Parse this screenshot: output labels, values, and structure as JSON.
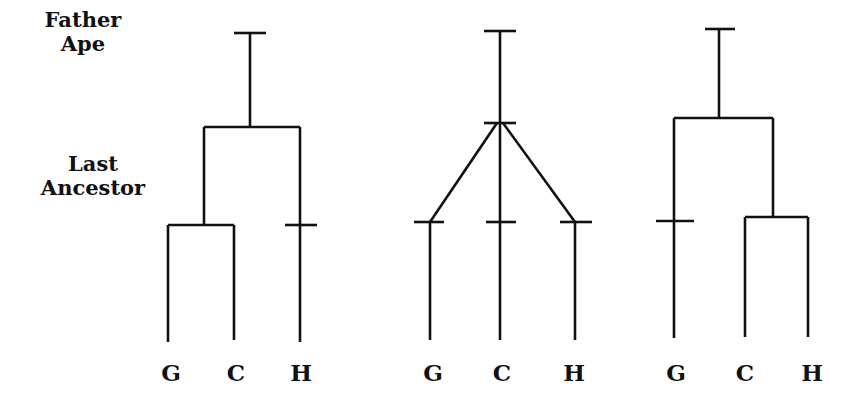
{
  "labels": {
    "father_ape": [
      "Father",
      "Ape"
    ],
    "last_ancestor": [
      "Last",
      "Ancestor"
    ]
  },
  "trees": [
    {
      "name": "tree-1",
      "description": "G and C share a last ancestor; H separate",
      "leaves": [
        "G",
        "C",
        "H"
      ]
    },
    {
      "name": "tree-2",
      "description": "Trichotomy: G, C, H diverge from one node",
      "leaves": [
        "G",
        "C",
        "H"
      ]
    },
    {
      "name": "tree-3",
      "description": "C and H share a last ancestor; G separate",
      "leaves": [
        "G",
        "C",
        "H"
      ]
    }
  ],
  "colors": {
    "line": "#111111",
    "background": "#ffffff"
  }
}
